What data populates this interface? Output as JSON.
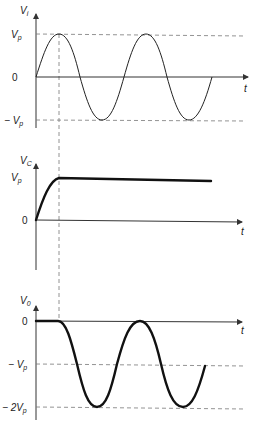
{
  "figure": {
    "panels": [
      {
        "id": "vi",
        "y_label": "V",
        "y_label_sub": "i",
        "x_label": "t",
        "ticks": [
          {
            "label": "V",
            "sub": "p",
            "prefix": ""
          },
          {
            "label": "0",
            "sub": "",
            "prefix": ""
          },
          {
            "label": "V",
            "sub": "p",
            "prefix": "− "
          }
        ],
        "description": "Input sinusoid swinging between +Vp and -Vp"
      },
      {
        "id": "vc",
        "y_label": "V",
        "y_label_sub": "C",
        "x_label": "t",
        "ticks": [
          {
            "label": "V",
            "sub": "p",
            "prefix": ""
          },
          {
            "label": "0",
            "sub": "",
            "prefix": ""
          }
        ],
        "description": "Capacitor voltage charges to Vp during first quarter cycle then stays constant"
      },
      {
        "id": "vo",
        "y_label": "V",
        "y_label_sub": "0",
        "x_label": "t",
        "ticks": [
          {
            "label": "0",
            "sub": "",
            "prefix": ""
          },
          {
            "label": "V",
            "sub": "p",
            "prefix": "− "
          },
          {
            "label": "2V",
            "sub": "p",
            "prefix": "− "
          }
        ],
        "description": "Output is zero for the first quarter cycle then a sinusoid swinging between 0 and -2Vp"
      }
    ]
  }
}
